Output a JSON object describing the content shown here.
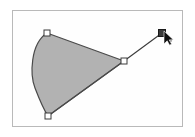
{
  "app": {
    "title": "Arc Shape Editing Canvas",
    "mode_label": "Edit Shape",
    "background_color": "#ffffff"
  },
  "canvas": {
    "name": "drawing-canvas",
    "x": 12,
    "y": 10,
    "width": 171,
    "height": 117,
    "fill_color": "#fefefe",
    "border_color": "#b9b9b9",
    "border_width": 1
  },
  "shape": {
    "name": "arc-pie-shape",
    "type": "arc",
    "fill_color": "#b2b2b2",
    "stroke_color": "#4a4a4a",
    "stroke_width": 1.2,
    "center_x": 124,
    "center_y": 61,
    "radius_x": 84,
    "radius_y": 58,
    "start_point": {
      "x": 47,
      "y": 33
    },
    "end_point": {
      "x": 48,
      "y": 116
    },
    "apex_point": {
      "x": 95,
      "y": 30
    },
    "path": "M 124 61 L 47 33 C 30 44 30 75 35 88 C 40 101 44 110 48 116 Z"
  },
  "chord": {
    "name": "chord-line",
    "from": {
      "x": 48,
      "y": 116
    },
    "to": {
      "x": 124,
      "y": 61
    },
    "stroke_color": "#4a4a4a",
    "stroke_width": 1.2
  },
  "drag_line": {
    "name": "radius-drag-line",
    "from": {
      "x": 124,
      "y": 61
    },
    "to": {
      "x": 162,
      "y": 33
    },
    "stroke_color": "#3a3a3a",
    "stroke_width": 1.1
  },
  "handles": [
    {
      "name": "handle-arc-start",
      "x": 47,
      "y": 33,
      "size": 6,
      "state": "unselected",
      "fill": "#ffffff",
      "stroke": "#3a3a3a"
    },
    {
      "name": "handle-arc-end",
      "x": 48,
      "y": 116,
      "size": 6,
      "state": "unselected",
      "fill": "#ffffff",
      "stroke": "#3a3a3a"
    },
    {
      "name": "handle-arc-center",
      "x": 124,
      "y": 61,
      "size": 6,
      "state": "unselected",
      "fill": "#ffffff",
      "stroke": "#3a3a3a"
    },
    {
      "name": "handle-drag-active",
      "x": 162,
      "y": 33,
      "size": 7,
      "state": "active",
      "fill": "#3a3a3a",
      "stroke": "#1a1a1a"
    }
  ],
  "cursor": {
    "name": "mouse-cursor-arrow",
    "x": 164,
    "y": 31,
    "color": "#111111",
    "type": "arrow"
  },
  "cursor_dot": {
    "name": "cursor-hotspot-dot",
    "x": 170,
    "y": 40,
    "radius": 2.2,
    "color": "#9a9a9a"
  }
}
